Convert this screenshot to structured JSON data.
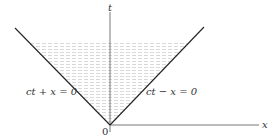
{
  "diagram": {
    "type": "light-cone",
    "axes": {
      "vertical_label": "t",
      "horizontal_label": "x",
      "origin_label": "0"
    },
    "lines": [
      {
        "label": "ct + x = 0"
      },
      {
        "label": "ct − x = 0"
      }
    ],
    "shaded_region": "future light cone interior",
    "colors": {
      "line": "#222222",
      "axis": "#555555",
      "shade": "#d8d8d8"
    }
  }
}
